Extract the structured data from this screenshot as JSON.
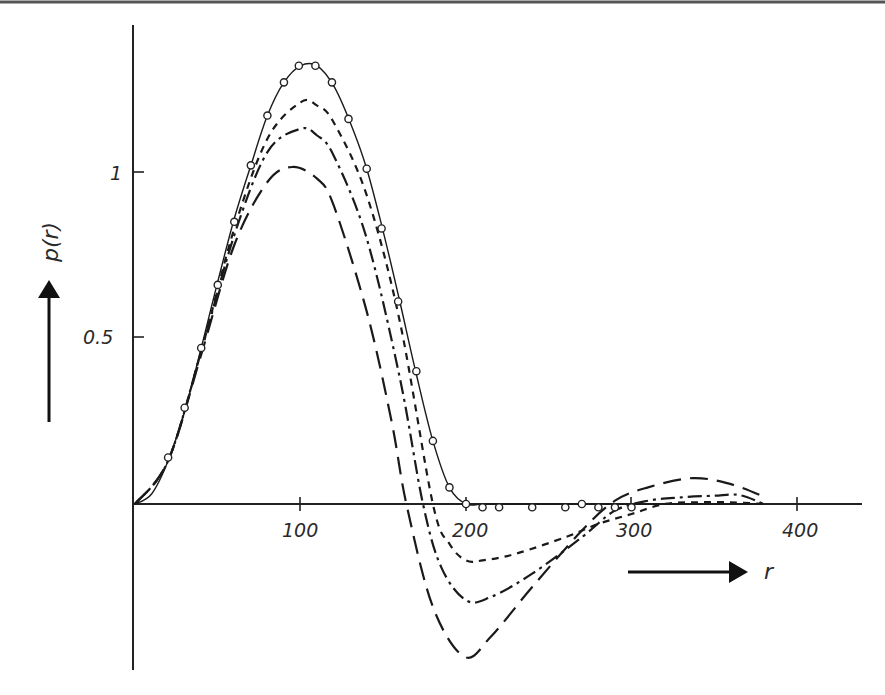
{
  "chart_data": {
    "type": "line",
    "title": "",
    "xlabel": "r",
    "ylabel": "p(r)",
    "xlim": [
      0,
      440
    ],
    "ylim": [
      -0.5,
      1.45
    ],
    "grid": false,
    "legend": null,
    "x_ticks": [
      100,
      200,
      300,
      400
    ],
    "x_tick_labels": [
      "100",
      "200",
      "300",
      "400"
    ],
    "y_ticks": [
      0.5,
      1
    ],
    "y_tick_labels": [
      "0.5",
      "1"
    ],
    "series": [
      {
        "name": "solid",
        "style": "solid",
        "markers": "open-circle",
        "x": [
          0,
          10,
          20,
          30,
          40,
          50,
          60,
          70,
          80,
          90,
          100,
          110,
          120,
          130,
          140,
          150,
          160,
          170,
          180,
          190,
          200,
          210,
          220,
          240,
          260,
          270,
          280,
          290,
          300,
          320,
          360,
          380
        ],
        "values": [
          0,
          0.03,
          0.13,
          0.28,
          0.47,
          0.67,
          0.86,
          1.02,
          1.17,
          1.27,
          1.32,
          1.32,
          1.26,
          1.15,
          1.01,
          0.82,
          0.61,
          0.39,
          0.19,
          0.05,
          0.0,
          0.0,
          0.0,
          0.0,
          0.0,
          0.0,
          0.0,
          0.0,
          0.0,
          0.0,
          0.0,
          0.0
        ]
      },
      {
        "name": "data points",
        "style": "markers",
        "x": [
          20,
          30,
          40,
          50,
          60,
          70,
          80,
          90,
          99,
          109,
          119,
          129,
          140,
          149,
          159,
          170,
          180,
          190,
          200,
          210,
          220,
          240,
          260,
          270,
          280,
          290,
          300
        ],
        "values": [
          0.14,
          0.29,
          0.47,
          0.66,
          0.85,
          1.02,
          1.17,
          1.27,
          1.32,
          1.32,
          1.27,
          1.16,
          1.01,
          0.83,
          0.61,
          0.4,
          0.19,
          0.05,
          0.0,
          -0.01,
          -0.01,
          -0.01,
          -0.01,
          0.0,
          -0.01,
          -0.01,
          -0.01
        ]
      },
      {
        "name": "short-dash",
        "style": "dashed",
        "x": [
          0,
          20,
          40,
          60,
          80,
          100,
          110,
          120,
          140,
          160,
          180,
          190,
          200,
          210,
          230,
          260,
          280,
          300,
          320,
          340,
          360,
          380
        ],
        "values": [
          0,
          0.13,
          0.46,
          0.83,
          1.1,
          1.21,
          1.2,
          1.15,
          0.93,
          0.55,
          0.0,
          -0.12,
          -0.17,
          -0.17,
          -0.15,
          -0.1,
          -0.06,
          -0.03,
          0.0,
          0.005,
          0.005,
          0.0
        ]
      },
      {
        "name": "dash-dot",
        "style": "dash-dot",
        "x": [
          0,
          20,
          40,
          60,
          80,
          100,
          110,
          120,
          140,
          160,
          174,
          185,
          200,
          215,
          240,
          270,
          290,
          310,
          330,
          350,
          365,
          380
        ],
        "values": [
          0,
          0.13,
          0.46,
          0.81,
          1.06,
          1.13,
          1.11,
          1.05,
          0.8,
          0.38,
          0.0,
          -0.19,
          -0.29,
          -0.28,
          -0.21,
          -0.1,
          -0.02,
          0.01,
          0.02,
          0.025,
          0.027,
          0.0
        ]
      },
      {
        "name": "long-dash",
        "style": "long-dash",
        "x": [
          0,
          20,
          40,
          60,
          80,
          95,
          110,
          120,
          140,
          155,
          164,
          180,
          199,
          215,
          240,
          270,
          290,
          310,
          337,
          360,
          381
        ],
        "values": [
          0,
          0.13,
          0.45,
          0.78,
          0.97,
          1.015,
          0.98,
          0.9,
          0.58,
          0.25,
          0.0,
          -0.31,
          -0.46,
          -0.4,
          -0.25,
          -0.08,
          0.01,
          0.05,
          0.078,
          0.06,
          0.02
        ]
      }
    ],
    "annotations": [
      "arrow pointing up beside p(r) label",
      "arrow pointing right beside r label"
    ]
  },
  "labels": {
    "ylabel": "p(r)",
    "xlabel": "r",
    "x_ticks": [
      "100",
      "200",
      "300",
      "400"
    ],
    "y_ticks": [
      "0.5",
      "1"
    ]
  }
}
